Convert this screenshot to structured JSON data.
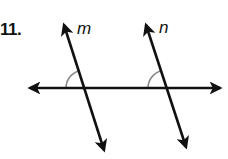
{
  "problem": {
    "number": "11."
  },
  "diagram": {
    "line_color": "#111111",
    "arc_color": "#8a8a8a",
    "lines": [
      {
        "label": "m",
        "x1": 63,
        "y1": 22,
        "x2": 105,
        "y2": 153
      },
      {
        "label": "n",
        "x1": 145,
        "y1": 22,
        "x2": 187,
        "y2": 150
      }
    ],
    "transversal": {
      "x1": 28,
      "y1": 88,
      "x2": 222,
      "y2": 88
    },
    "angle_marks": [
      {
        "at_line": "m",
        "position": "upper-left",
        "cx": 84,
        "cy": 88,
        "r": 18
      },
      {
        "at_line": "n",
        "position": "upper-left",
        "cx": 166,
        "cy": 88,
        "r": 18
      }
    ],
    "labels": {
      "m": "m",
      "n": "n"
    }
  }
}
